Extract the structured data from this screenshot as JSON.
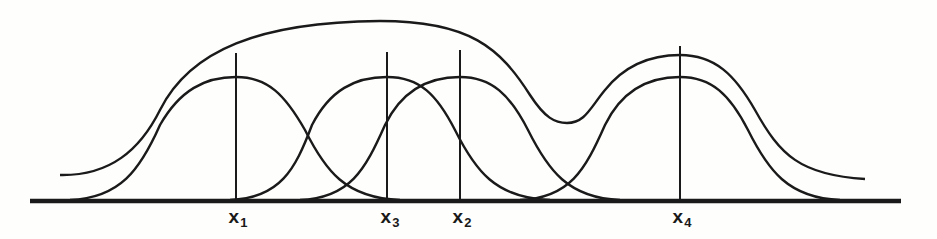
{
  "diagram": {
    "colors": {
      "ink": "#1a1a1a",
      "background": "#fefefc"
    },
    "baseline": {
      "y": 201,
      "x_start": 30,
      "x_end": 901
    },
    "peaks": [
      {
        "id": "x1",
        "label": "x",
        "subscript": "1",
        "center_px": 236,
        "peak_y": 77,
        "line_top": 53
      },
      {
        "id": "x3",
        "label": "x",
        "subscript": "3",
        "center_px": 387,
        "peak_y": 77,
        "line_top": 52
      },
      {
        "id": "x2",
        "label": "x",
        "subscript": "2",
        "center_px": 460,
        "peak_y": 77,
        "line_top": 50
      },
      {
        "id": "x4",
        "label": "x",
        "subscript": "4",
        "center_px": 680,
        "peak_y": 77,
        "line_top": 46
      }
    ],
    "envelope": {
      "start": [
        60,
        175
      ],
      "dip": [
        565,
        122
      ],
      "right_peak": [
        680,
        55
      ],
      "end": [
        865,
        179
      ]
    }
  }
}
